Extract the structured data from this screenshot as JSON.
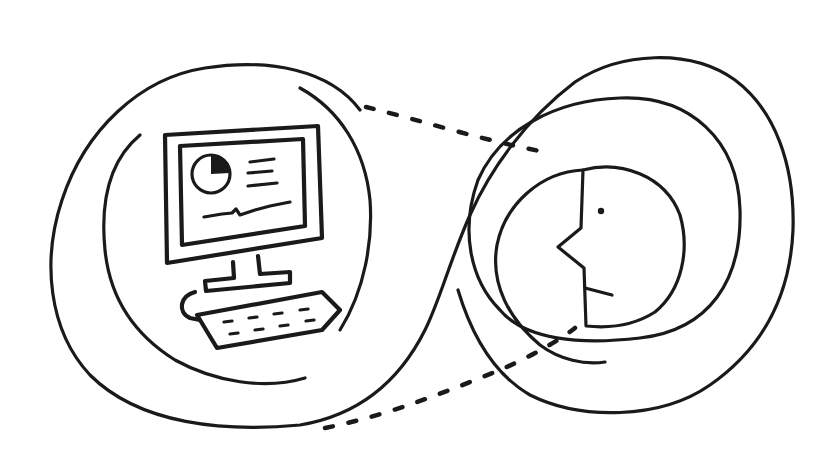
{
  "illustration": {
    "description": "Hand-drawn line art: a desktop computer inside a rounded loop connected by dashed lines to a human face profile inside concentric rings",
    "left_group": {
      "name": "computer",
      "elements": [
        "monitor",
        "pie-chart",
        "text-lines",
        "trend-line",
        "monitor-stand",
        "keyboard"
      ]
    },
    "right_group": {
      "name": "person",
      "elements": [
        "face-profile",
        "eye",
        "nose",
        "mouth"
      ]
    },
    "connectors": [
      "dashed-line-top",
      "dashed-line-bottom"
    ],
    "colors": {
      "ink": "#1a1a1a",
      "background": "#ffffff"
    }
  }
}
